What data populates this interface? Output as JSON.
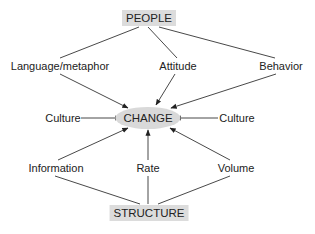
{
  "diagram": {
    "type": "concept-map",
    "colors": {
      "box_fill": "#dcdcdc",
      "line": "#333333",
      "text": "#222222",
      "background": "#ffffff"
    },
    "top_node": {
      "label": "PEOPLE"
    },
    "center_node": {
      "label": "CHANGE"
    },
    "bottom_node": {
      "label": "STRUCTURE"
    },
    "people_factors": [
      {
        "label": "Language/metaphor"
      },
      {
        "label": "Attitude"
      },
      {
        "label": "Behavior"
      }
    ],
    "culture_left": {
      "label": "Culture"
    },
    "culture_right": {
      "label": "Culture"
    },
    "structure_factors": [
      {
        "label": "Information"
      },
      {
        "label": "Rate"
      },
      {
        "label": "Volume"
      }
    ],
    "edges": [
      {
        "from": "PEOPLE",
        "to": "Language/metaphor",
        "arrow": false
      },
      {
        "from": "PEOPLE",
        "to": "Attitude",
        "arrow": false
      },
      {
        "from": "PEOPLE",
        "to": "Behavior",
        "arrow": false
      },
      {
        "from": "Language/metaphor",
        "to": "CHANGE",
        "arrow": true
      },
      {
        "from": "Attitude",
        "to": "CHANGE",
        "arrow": true
      },
      {
        "from": "Behavior",
        "to": "CHANGE",
        "arrow": true
      },
      {
        "from": "Culture (left)",
        "to": "CHANGE",
        "arrow": true
      },
      {
        "from": "Culture (right)",
        "to": "CHANGE",
        "arrow": true
      },
      {
        "from": "Information",
        "to": "CHANGE",
        "arrow": true
      },
      {
        "from": "Rate",
        "to": "CHANGE",
        "arrow": true
      },
      {
        "from": "Volume",
        "to": "CHANGE",
        "arrow": true
      },
      {
        "from": "STRUCTURE",
        "to": "Information",
        "arrow": false
      },
      {
        "from": "STRUCTURE",
        "to": "Rate",
        "arrow": false
      },
      {
        "from": "STRUCTURE",
        "to": "Volume",
        "arrow": false
      }
    ]
  }
}
